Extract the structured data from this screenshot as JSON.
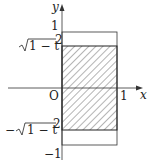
{
  "diagram": {
    "axes": {
      "x_label": "x",
      "y_label": "y",
      "origin_label": "O"
    },
    "ticks": {
      "x_one": "1",
      "y_one": "1",
      "y_minus_one": "−1"
    },
    "bounds": {
      "upper": "√1 − t²",
      "lower": "−√1 − t²",
      "upper_radicand": "1 − t",
      "upper_sup": "2",
      "lower_prefix": "−"
    },
    "region": {
      "description": "hatched rectangle 0≤x≤1, −√(1−t²)≤y≤√(1−t²)"
    }
  }
}
